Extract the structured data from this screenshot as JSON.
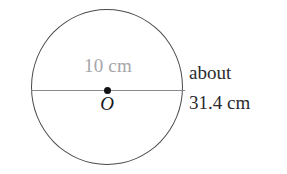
{
  "figure": {
    "type": "geometry-diagram",
    "background_color": "#ffffff",
    "circle": {
      "stroke_color": "#4a4a4f",
      "fill": "none"
    },
    "diameter": {
      "label": "10 cm",
      "label_color": "#a6a6aa",
      "line_color": "#8a8a8e"
    },
    "center": {
      "label": "O",
      "label_color": "#17171a",
      "dot_color": "#111114"
    },
    "circumference": {
      "line1": "about",
      "line2": "31.4 cm",
      "text_color": "#2a2a2e"
    }
  }
}
